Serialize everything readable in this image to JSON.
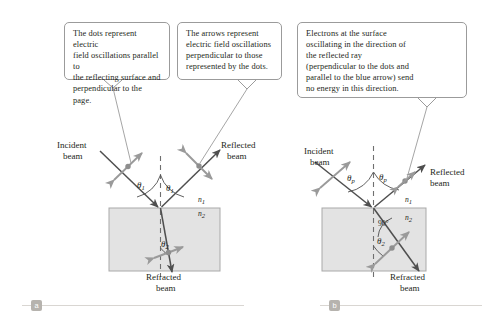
{
  "figure": {
    "panels": [
      {
        "id": "a",
        "badge": "a",
        "labels": {
          "incident": "Incident",
          "incident2": "beam",
          "reflected": "Reflected",
          "reflected2": "beam",
          "refracted": "Refracted",
          "refracted2": "beam",
          "theta_incident": "θ",
          "theta_incident_sub": "1",
          "theta_reflected": "θ",
          "theta_reflected_sub": "1",
          "theta_refracted": "θ",
          "theta_refracted_sub": "2",
          "n1": "n",
          "n1_sub": "1",
          "n2": "n",
          "n2_sub": "2"
        }
      },
      {
        "id": "b",
        "badge": "b",
        "labels": {
          "incident": "Incident",
          "incident2": "beam",
          "reflected": "Reflected",
          "reflected2": "beam",
          "refracted": "Refracted",
          "refracted2": "beam",
          "theta_incident": "θ",
          "theta_incident_sub": "p",
          "theta_reflected": "θ",
          "theta_reflected_sub": "p",
          "theta_refracted": "θ",
          "theta_refracted_sub": "2",
          "right_angle": "90°",
          "n1": "n",
          "n1_sub": "1",
          "n2": "n",
          "n2_sub": "2"
        }
      }
    ],
    "callouts": [
      {
        "id": "callout-1",
        "lines": [
          "The dots represent electric",
          "field oscillations parallel to",
          "the reflecting surface and",
          "perpendicular to the page."
        ]
      },
      {
        "id": "callout-2",
        "lines": [
          "The arrows represent",
          "electric field oscillations",
          "perpendicular to those",
          "represented by the dots."
        ]
      },
      {
        "id": "callout-3",
        "lines": [
          "Electrons at the surface",
          "oscillating in the direction of",
          "the reflected ray",
          "(perpendicular to the dots and",
          "parallel to the blue arrow) send",
          "no energy in this direction."
        ]
      }
    ],
    "colors": {
      "ray": "#4f4f4f",
      "marker": "#9a9a9a",
      "medium_fill": "#e3e3e3",
      "medium_border": "#a9a9a9",
      "callout_border": "#9b9b9b",
      "leader": "#9b9b9b",
      "normal_dash": "#6f6f6f",
      "badge_bg": "#b6b3ae",
      "rule": "#d9d6d2",
      "text": "#231f20"
    }
  }
}
